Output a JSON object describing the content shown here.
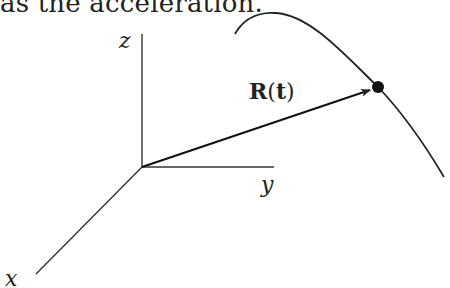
{
  "caption": {
    "text": "as the acceleration."
  },
  "diagram": {
    "type": "3d-position-vector",
    "axes": {
      "z": {
        "label": "z"
      },
      "y": {
        "label": "y"
      },
      "x": {
        "label": "x"
      }
    },
    "vector": {
      "label_bold": "R",
      "label_open": "(",
      "label_arg": "t",
      "label_close": ")"
    },
    "curve": {
      "description": "space curve traced by the position vector"
    },
    "point": {
      "description": "tip of position vector on curve"
    },
    "colors": {
      "stroke": "#222222",
      "background": "#ffffff"
    }
  }
}
